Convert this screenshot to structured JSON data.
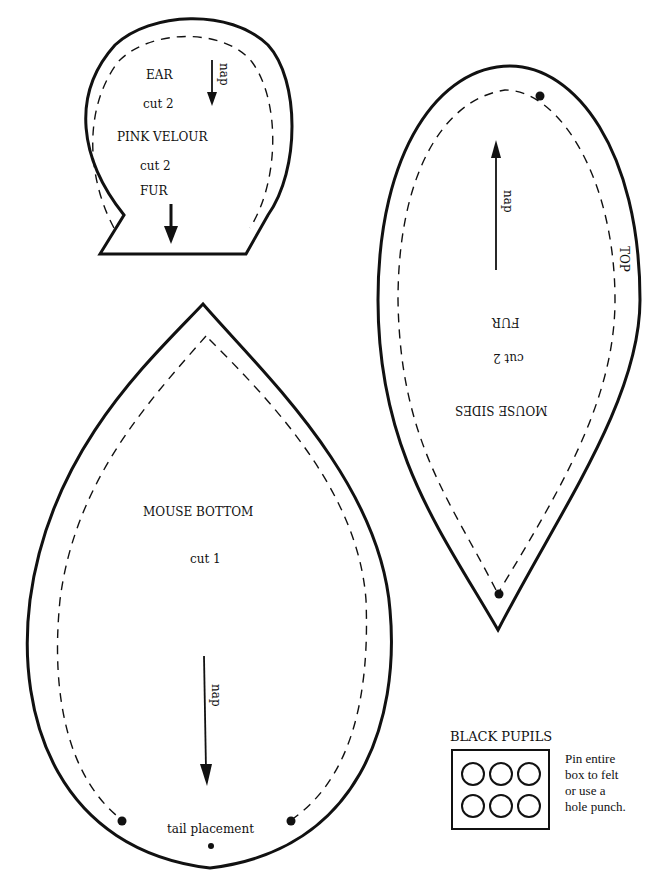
{
  "ear": {
    "title": "EAR",
    "cut_ear": "cut 2",
    "material_1": "PINK VELOUR",
    "cut_material": "cut 2",
    "material_2": "FUR",
    "nap": "nap"
  },
  "mouse_sides": {
    "title": "MOUSE SIDES",
    "cut": "cut 2",
    "material": "FUR",
    "edge_label": "TOP",
    "nap": "nap"
  },
  "mouse_bottom": {
    "title": "MOUSE BOTTOM",
    "cut": "cut 1",
    "nap": "nap",
    "tail_label": "tail placement"
  },
  "black_pupils": {
    "title": "BLACK PUPILS",
    "circle_count": 6,
    "instructions": [
      "Pin entire",
      "box to felt",
      "or use a",
      "hole punch."
    ]
  },
  "colors": {
    "line": "#111111",
    "background": "#ffffff"
  }
}
